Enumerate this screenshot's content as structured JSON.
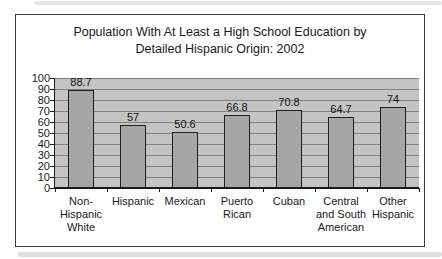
{
  "chart_data": {
    "type": "bar",
    "title": "Population With At Least a High School Education by Detailed Hispanic Origin: 2002",
    "title_lines": [
      "Population With At Least a High School Education by",
      "Detailed Hispanic Origin: 2002"
    ],
    "categories": [
      "Non-Hispanic White",
      "Hispanic",
      "Mexican",
      "Puerto Rican",
      "Cuban",
      "Central and South American",
      "Other Hispanic"
    ],
    "category_label_lines": [
      [
        "Non-",
        "Hispanic",
        "White"
      ],
      [
        "Hispanic"
      ],
      [
        "Mexican"
      ],
      [
        "Puerto",
        "Rican"
      ],
      [
        "Cuban"
      ],
      [
        "Central",
        "and South",
        "American"
      ],
      [
        "Other",
        "Hispanic"
      ]
    ],
    "values": [
      88.7,
      57,
      50.6,
      66.8,
      70.8,
      64.7,
      74
    ],
    "value_labels": [
      "88.7",
      "57",
      "50.6",
      "66.8",
      "70.8",
      "64.7",
      "74"
    ],
    "xlabel": "",
    "ylabel": "",
    "ylim": [
      0,
      100
    ],
    "yticks": [
      0,
      10,
      20,
      30,
      40,
      50,
      60,
      70,
      80,
      90,
      100
    ],
    "grid": true,
    "legend": "none",
    "colors": {
      "background": "#ffffff",
      "frame_border": "#3a3a3a",
      "plot_bg": "#c4c4c4",
      "bar_fill": "#a6a6a6",
      "bar_border": "#1f1f1f",
      "gridline": "#808080",
      "axis": "#1a1a1a",
      "text": "#1a1a1a"
    }
  }
}
